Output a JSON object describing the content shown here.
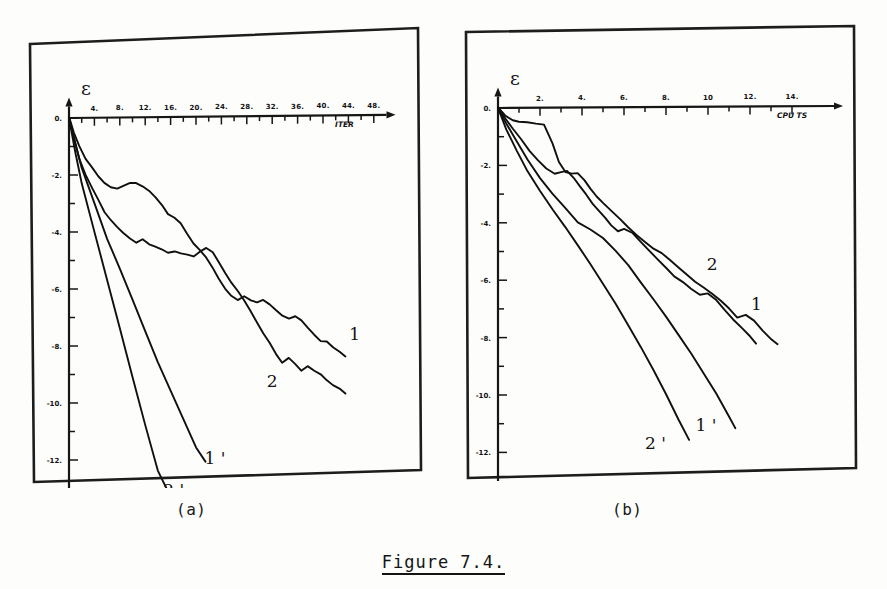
{
  "figure": {
    "caption": "Figure 7.4.",
    "panel_a_label": "(a)",
    "panel_b_label": "(b)"
  },
  "chart_data": [
    {
      "id": "panel-a",
      "type": "line",
      "title": "",
      "panel_label": "(a)",
      "xlabel": "ITER",
      "ylabel": "ε",
      "xlim": [
        0,
        50
      ],
      "ylim": [
        -13,
        0.4
      ],
      "grid": false,
      "legend": "inline-curve-labels",
      "xticks": [
        4,
        8,
        12,
        16,
        20,
        24,
        28,
        32,
        36,
        40,
        44,
        48
      ],
      "xticklabels": [
        "4.",
        "8.",
        "12.",
        "16.",
        "20.",
        "24.",
        "28.",
        "32.",
        "36.",
        "40.",
        "44.",
        "48."
      ],
      "yticks": [
        0,
        -2,
        -4,
        -6,
        -8,
        -10,
        -12
      ],
      "yticklabels": [
        "0.",
        "-2.",
        "-4.",
        "-6.",
        "-8.",
        "-10.",
        "-12."
      ],
      "series": [
        {
          "name": "1",
          "label": "1",
          "x": [
            0.0,
            0.8,
            1.6,
            2.6,
            3.6,
            4.6,
            5.6,
            6.6,
            7.6,
            8.6,
            9.6,
            10.6,
            11.6,
            12.6,
            13.6,
            14.6,
            15.6,
            16.6,
            17.6,
            18.6,
            19.6,
            20.6,
            21.6,
            22.6,
            23.6,
            24.6,
            25.6,
            26.6,
            27.6,
            28.6,
            29.6,
            30.6,
            31.6,
            32.6,
            33.6,
            34.6,
            35.6,
            36.6,
            37.6,
            38.6,
            39.6,
            40.6,
            41.6,
            42.6,
            43.5
          ],
          "y": [
            0.0,
            -0.5,
            -1.0,
            -1.45,
            -1.75,
            -2.05,
            -2.3,
            -2.45,
            -2.5,
            -2.4,
            -2.3,
            -2.32,
            -2.45,
            -2.6,
            -2.8,
            -3.1,
            -3.4,
            -3.55,
            -3.75,
            -4.1,
            -4.45,
            -4.7,
            -4.95,
            -5.3,
            -5.7,
            -6.05,
            -6.3,
            -6.45,
            -6.3,
            -6.45,
            -6.55,
            -6.45,
            -6.6,
            -6.8,
            -7.0,
            -7.1,
            -7.05,
            -7.2,
            -7.45,
            -7.7,
            -7.9,
            -7.95,
            -8.15,
            -8.3,
            -8.45
          ]
        },
        {
          "name": "2",
          "label": "2",
          "x": [
            0.0,
            0.8,
            1.6,
            2.6,
            3.6,
            4.6,
            5.6,
            6.6,
            7.6,
            8.6,
            9.6,
            10.6,
            11.6,
            12.6,
            13.6,
            14.6,
            15.6,
            16.6,
            17.6,
            18.6,
            19.6,
            20.6,
            21.6,
            22.6,
            23.6,
            24.6,
            25.6,
            26.6,
            27.6,
            28.6,
            29.6,
            30.6,
            31.6,
            32.6,
            33.6,
            34.6,
            35.6,
            36.6,
            37.6,
            38.6,
            39.6,
            40.6,
            41.6,
            42.6,
            43.5
          ],
          "y": [
            0.0,
            -0.7,
            -1.4,
            -2.0,
            -2.45,
            -2.9,
            -3.3,
            -3.6,
            -3.85,
            -4.05,
            -4.25,
            -4.4,
            -4.3,
            -4.45,
            -4.55,
            -4.65,
            -4.75,
            -4.7,
            -4.8,
            -4.85,
            -4.9,
            -4.75,
            -4.6,
            -4.75,
            -5.1,
            -5.5,
            -5.85,
            -6.15,
            -6.45,
            -6.85,
            -7.25,
            -7.6,
            -7.95,
            -8.35,
            -8.65,
            -8.5,
            -8.7,
            -8.95,
            -8.8,
            -8.95,
            -9.1,
            -9.3,
            -9.45,
            -9.6,
            -9.75
          ]
        },
        {
          "name": "1prime",
          "label": "1 '",
          "x": [
            0.0,
            1.0,
            2.0,
            4.0,
            6.0,
            8.0,
            10.0,
            12.0,
            14.0,
            16.0,
            18.0,
            20.0,
            21.5
          ],
          "y": [
            0.0,
            -0.9,
            -1.75,
            -3.0,
            -4.25,
            -5.3,
            -6.4,
            -7.5,
            -8.6,
            -9.6,
            -10.6,
            -11.6,
            -12.1
          ]
        },
        {
          "name": "2prime",
          "label": "2 '",
          "x": [
            0.0,
            1.0,
            2.0,
            4.0,
            6.0,
            8.0,
            10.0,
            12.0,
            14.0,
            15.5
          ],
          "y": [
            0.0,
            -1.2,
            -2.3,
            -4.0,
            -5.7,
            -7.4,
            -9.1,
            -10.8,
            -12.4,
            -13.1
          ]
        }
      ],
      "annotations": [
        {
          "text": "1",
          "x": 45.0,
          "y": -7.9
        },
        {
          "text": "2",
          "x": 32.0,
          "y": -9.5
        },
        {
          "text": "1 '",
          "x": 23.0,
          "y": -12.2
        },
        {
          "text": "2 '",
          "x": 16.5,
          "y": -13.3
        }
      ]
    },
    {
      "id": "panel-b",
      "type": "line",
      "title": "",
      "panel_label": "(b)",
      "xlabel": "CPU TS",
      "ylabel": "ε",
      "xlim": [
        0,
        16
      ],
      "ylim": [
        -13,
        0.4
      ],
      "grid": false,
      "legend": "inline-curve-labels",
      "xticks": [
        2,
        4,
        6,
        8,
        10,
        12,
        14
      ],
      "xticklabels": [
        "2.",
        "4.",
        "6.",
        "8.",
        "10",
        "12.",
        "14."
      ],
      "yticks": [
        0,
        -2,
        -4,
        -6,
        -8,
        -10,
        -12
      ],
      "yticklabels": [
        "0.",
        "-2.",
        "-4.",
        "-6.",
        "-8.",
        "-10.",
        "-12."
      ],
      "series": [
        {
          "name": "1",
          "label": "1",
          "x": [
            0.0,
            0.35,
            0.7,
            1.0,
            1.4,
            1.8,
            2.2,
            2.6,
            2.9,
            3.2,
            3.5,
            3.8,
            4.1,
            4.4,
            4.7,
            5.0,
            5.4,
            5.8,
            6.2,
            6.6,
            7.0,
            7.4,
            7.8,
            8.2,
            8.6,
            9.0,
            9.4,
            9.8,
            10.2,
            10.6,
            11.0,
            11.4,
            11.8,
            12.2,
            12.6,
            13.0,
            13.3
          ],
          "y": [
            0.0,
            -0.25,
            -0.45,
            -0.5,
            -0.52,
            -0.55,
            -0.6,
            -1.25,
            -1.9,
            -2.25,
            -2.3,
            -2.3,
            -2.55,
            -2.85,
            -3.1,
            -3.35,
            -3.6,
            -3.9,
            -4.2,
            -4.45,
            -4.7,
            -4.95,
            -5.1,
            -5.35,
            -5.6,
            -5.85,
            -6.1,
            -6.3,
            -6.5,
            -6.75,
            -7.05,
            -7.35,
            -7.25,
            -7.45,
            -7.8,
            -8.1,
            -8.3
          ]
        },
        {
          "name": "2",
          "label": "2",
          "x": [
            0.0,
            0.35,
            0.7,
            1.1,
            1.5,
            1.9,
            2.3,
            2.7,
            3.0,
            3.3,
            3.6,
            3.9,
            4.2,
            4.5,
            4.8,
            5.1,
            5.4,
            5.7,
            6.0,
            6.4,
            6.8,
            7.2,
            7.6,
            8.0,
            8.4,
            8.8,
            9.2,
            9.6,
            10.0,
            10.4,
            10.8,
            11.2,
            11.6,
            12.0,
            12.3
          ],
          "y": [
            0.0,
            -0.35,
            -0.7,
            -1.1,
            -1.5,
            -1.85,
            -2.1,
            -2.3,
            -2.25,
            -2.2,
            -2.45,
            -2.75,
            -3.05,
            -3.35,
            -3.6,
            -3.85,
            -4.1,
            -4.3,
            -4.25,
            -4.4,
            -4.7,
            -5.0,
            -5.3,
            -5.6,
            -5.9,
            -6.1,
            -6.35,
            -6.55,
            -6.5,
            -6.75,
            -7.1,
            -7.4,
            -7.7,
            -8.0,
            -8.25
          ]
        },
        {
          "name": "1prime",
          "label": "1 '",
          "x": [
            0.0,
            0.4,
            0.8,
            1.4,
            2.0,
            2.6,
            3.2,
            3.8,
            4.4,
            5.0,
            5.6,
            6.2,
            6.8,
            7.4,
            8.0,
            8.6,
            9.2,
            9.8,
            10.4,
            11.0,
            11.3
          ],
          "y": [
            0.0,
            -0.55,
            -1.05,
            -1.8,
            -2.45,
            -3.0,
            -3.5,
            -4.0,
            -4.25,
            -4.55,
            -5.0,
            -5.5,
            -6.1,
            -6.7,
            -7.3,
            -7.95,
            -8.6,
            -9.3,
            -10.0,
            -10.8,
            -11.2
          ]
        },
        {
          "name": "2prime",
          "label": "2 '",
          "x": [
            0.0,
            0.4,
            0.9,
            1.4,
            2.0,
            2.6,
            3.2,
            3.8,
            4.4,
            5.0,
            5.6,
            6.2,
            6.8,
            7.4,
            8.0,
            8.6,
            9.1
          ],
          "y": [
            0.0,
            -0.75,
            -1.5,
            -2.2,
            -2.9,
            -3.55,
            -4.15,
            -4.8,
            -5.45,
            -6.15,
            -6.85,
            -7.6,
            -8.35,
            -9.15,
            -10.0,
            -10.9,
            -11.6
          ]
        }
      ],
      "annotations": [
        {
          "text": "2",
          "x": 10.2,
          "y": -5.7
        },
        {
          "text": "1",
          "x": 12.3,
          "y": -7.1
        },
        {
          "text": "1 '",
          "x": 9.9,
          "y": -11.3
        },
        {
          "text": "2 '",
          "x": 7.5,
          "y": -11.9
        }
      ]
    }
  ]
}
